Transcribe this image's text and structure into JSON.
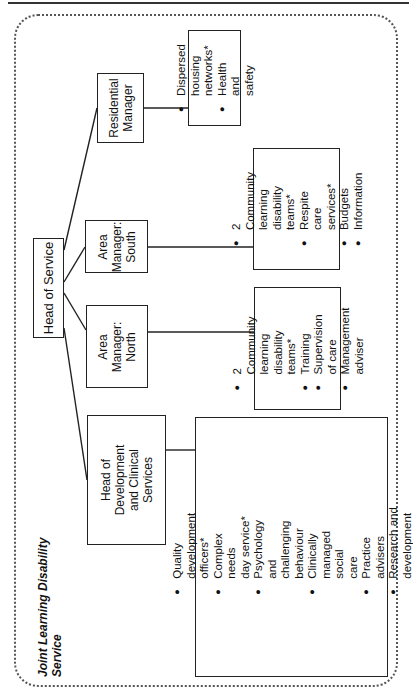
{
  "title": "Joint Learning Disability\nService",
  "root": {
    "label": "Head of Service"
  },
  "managers": [
    {
      "id": "dev",
      "label": "Head of\nDevelopment\nand Clinical\nServices",
      "items": [
        "Quality\ndevelopment\nofficers*",
        "Complex needs\nday service*",
        "Psychology and\nchallenging\nbehaviour",
        "Clinically\nmanaged social\ncare",
        "Practice advisers",
        "Research and\ndevelopment"
      ]
    },
    {
      "id": "north",
      "label": "Area\nManager:\nNorth",
      "items": [
        "2 Community learning\ndisability teams*",
        "Training",
        "Supervision of care",
        "Management adviser"
      ]
    },
    {
      "id": "south",
      "label": "Area\nManager:\nSouth",
      "items": [
        "2 Community learning\ndisability teams*",
        "Respite care services*",
        "Budgets",
        "Information"
      ]
    },
    {
      "id": "residential",
      "label": "Residential\nManager",
      "items": [
        "Dispersed housing\nnetworks*",
        "Health and safety"
      ]
    }
  ]
}
